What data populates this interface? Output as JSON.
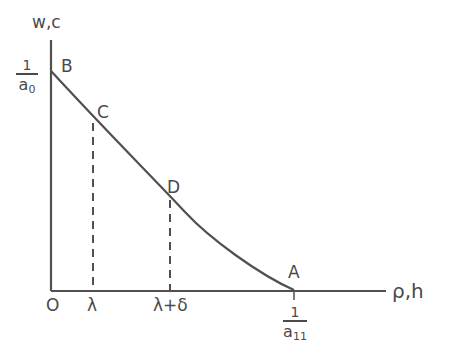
{
  "diagram": {
    "y_axis_label": "w,c",
    "x_axis_label": "ρ,h",
    "origin_label": "O",
    "points": [
      {
        "id": "B",
        "label": "B"
      },
      {
        "id": "C",
        "label": "C"
      },
      {
        "id": "D",
        "label": "D"
      },
      {
        "id": "A",
        "label": "A"
      }
    ],
    "x_ticks": [
      {
        "label": "λ"
      },
      {
        "label": "λ+δ"
      }
    ],
    "y_intercept": {
      "numerator": "1",
      "denominator": "a",
      "subscript": "0"
    },
    "x_intercept": {
      "numerator": "1",
      "denominator": "a",
      "subscript": "11"
    },
    "colors": {
      "line": "#505050",
      "text": "#4a4a4a",
      "background": "#ffffff"
    }
  }
}
